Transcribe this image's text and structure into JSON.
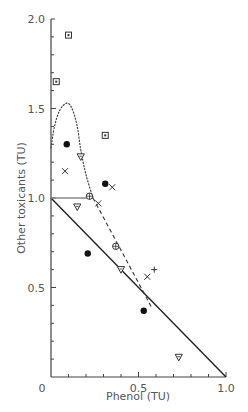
{
  "chart_data": {
    "type": "scatter",
    "title": "",
    "xlabel": "Phenol (TU)",
    "ylabel": "Other toxicants (TU)",
    "xlim": [
      0,
      1.0
    ],
    "ylim": [
      0,
      2.0
    ],
    "x_ticks": [
      "0",
      "0.5",
      "1.0"
    ],
    "y_ticks": [
      "0.5",
      "1.0",
      "1.5",
      "2.0"
    ],
    "grid": false,
    "legend": null,
    "series": [
      {
        "name": "filled-circle",
        "marker": "filled-circle",
        "points": [
          [
            0.09,
            1.3
          ],
          [
            0.31,
            1.08
          ],
          [
            0.21,
            0.69
          ],
          [
            0.53,
            0.37
          ]
        ]
      },
      {
        "name": "boxed-dot",
        "marker": "boxed-dot",
        "points": [
          [
            0.1,
            1.91
          ],
          [
            0.03,
            1.65
          ],
          [
            0.31,
            1.35
          ]
        ]
      },
      {
        "name": "triangle-down",
        "marker": "triangle-down",
        "points": [
          [
            0.17,
            1.23
          ],
          [
            0.15,
            0.95
          ],
          [
            0.4,
            0.6
          ],
          [
            0.73,
            0.11
          ]
        ]
      },
      {
        "name": "x-cross",
        "marker": "x",
        "points": [
          [
            0.08,
            1.15
          ],
          [
            0.35,
            1.06
          ],
          [
            0.27,
            0.97
          ],
          [
            0.55,
            0.56
          ]
        ]
      },
      {
        "name": "circled-cross",
        "marker": "circled-plus",
        "points": [
          [
            0.22,
            1.01
          ],
          [
            0.37,
            0.73
          ]
        ]
      },
      {
        "name": "plus",
        "marker": "plus",
        "points": [
          [
            0.59,
            0.6
          ]
        ]
      }
    ],
    "lines": [
      {
        "name": "additivity-line",
        "style": "solid",
        "points": [
          [
            0,
            1.0
          ],
          [
            1.0,
            0
          ]
        ]
      },
      {
        "name": "horizontal-line",
        "style": "solid-gray",
        "points": [
          [
            0,
            1.0
          ],
          [
            0.24,
            1.0
          ]
        ]
      },
      {
        "name": "dashed-line",
        "style": "dashed",
        "points": [
          [
            0.24,
            1.0
          ],
          [
            0.58,
            0.38
          ]
        ]
      },
      {
        "name": "dotted-curve",
        "style": "dotted",
        "points": [
          [
            0,
            1.28
          ],
          [
            0.02,
            1.4
          ],
          [
            0.05,
            1.49
          ],
          [
            0.09,
            1.53
          ],
          [
            0.12,
            1.5
          ],
          [
            0.15,
            1.4
          ],
          [
            0.17,
            1.27
          ],
          [
            0.2,
            1.13
          ],
          [
            0.24,
            1.0
          ]
        ]
      }
    ]
  }
}
